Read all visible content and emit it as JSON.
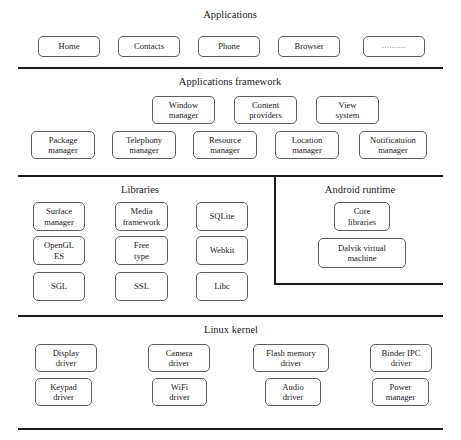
{
  "diagram": {
    "accent_color": "#1c1c1c",
    "box_border_color": "#5d5d5d"
  },
  "layers": [
    {
      "id": "applications",
      "caption": "Applications",
      "nodes": [
        {
          "label": "Home",
          "x": 38,
          "y": 36,
          "w": 62,
          "h": 21
        },
        {
          "label": "Contacts",
          "x": 118,
          "y": 36,
          "w": 62,
          "h": 21
        },
        {
          "label": "Phone",
          "x": 198,
          "y": 36,
          "w": 62,
          "h": 21
        },
        {
          "label": "Browser",
          "x": 278,
          "y": 36,
          "w": 62,
          "h": 21
        },
        {
          "label": "..........",
          "x": 363,
          "y": 36,
          "w": 62,
          "h": 21,
          "style": "dots"
        }
      ]
    },
    {
      "id": "applications-framework",
      "caption": "Applications framework",
      "nodes": [
        {
          "label": "Window\nmanager",
          "x": 152,
          "y": 96,
          "w": 63,
          "h": 28
        },
        {
          "label": "Content\nproviders",
          "x": 234,
          "y": 96,
          "w": 63,
          "h": 28
        },
        {
          "label": "View\nsystem",
          "x": 316,
          "y": 96,
          "w": 63,
          "h": 28
        },
        {
          "label": "Package\nmanager",
          "x": 31,
          "y": 131,
          "w": 64,
          "h": 28
        },
        {
          "label": "Telephony\nmanager",
          "x": 112,
          "y": 131,
          "w": 64,
          "h": 28
        },
        {
          "label": "Resource\nmanager",
          "x": 193,
          "y": 131,
          "w": 64,
          "h": 28
        },
        {
          "label": "Location\nmanager",
          "x": 275,
          "y": 131,
          "w": 64,
          "h": 28
        },
        {
          "label": "Notificatuion\nmanager",
          "x": 359,
          "y": 131,
          "w": 68,
          "h": 28
        }
      ]
    },
    {
      "id": "libraries",
      "caption": "Libraries",
      "nodes": [
        {
          "label": "Surface\nmanager",
          "x": 33,
          "y": 202,
          "w": 52,
          "h": 29
        },
        {
          "label": "Media\nframework",
          "x": 115,
          "y": 202,
          "w": 53,
          "h": 29
        },
        {
          "label": "SQLite",
          "x": 196,
          "y": 202,
          "w": 52,
          "h": 29
        },
        {
          "label": "OpenGL\nES",
          "x": 33,
          "y": 236,
          "w": 52,
          "h": 29
        },
        {
          "label": "Free\ntype",
          "x": 115,
          "y": 236,
          "w": 53,
          "h": 29
        },
        {
          "label": "Webkit",
          "x": 196,
          "y": 236,
          "w": 52,
          "h": 29
        },
        {
          "label": "SGL",
          "x": 33,
          "y": 272,
          "w": 52,
          "h": 29
        },
        {
          "label": "SSL",
          "x": 115,
          "y": 272,
          "w": 53,
          "h": 29
        },
        {
          "label": "Libc",
          "x": 196,
          "y": 272,
          "w": 52,
          "h": 29
        }
      ]
    },
    {
      "id": "android-runtime",
      "caption": "Android runtime",
      "nodes": [
        {
          "label": "Core\nlibraries",
          "x": 334,
          "y": 202,
          "w": 56,
          "h": 29
        },
        {
          "label": "Dalvik virtual\nmachine",
          "x": 318,
          "y": 238,
          "w": 88,
          "h": 30
        }
      ]
    },
    {
      "id": "linux-kernel",
      "caption": "Linux kernel",
      "nodes": [
        {
          "label": "Display\ndriver",
          "x": 35,
          "y": 344,
          "w": 62,
          "h": 28
        },
        {
          "label": "Camera\ndriver",
          "x": 148,
          "y": 344,
          "w": 62,
          "h": 28
        },
        {
          "label": "Flash memory\ndriver",
          "x": 253,
          "y": 344,
          "w": 76,
          "h": 28
        },
        {
          "label": "Binder IPC\ndriver",
          "x": 370,
          "y": 344,
          "w": 62,
          "h": 28
        },
        {
          "label": "Keypad\ndriver",
          "x": 35,
          "y": 378,
          "w": 57,
          "h": 28
        },
        {
          "label": "WiFi\ndriver",
          "x": 152,
          "y": 378,
          "w": 55,
          "h": 28
        },
        {
          "label": "Audio\ndriver",
          "x": 265,
          "y": 378,
          "w": 56,
          "h": 28
        },
        {
          "label": "Power\nmanager",
          "x": 372,
          "y": 378,
          "w": 57,
          "h": 28
        }
      ]
    }
  ],
  "captions": [
    {
      "text": "Applications",
      "x": 180,
      "y": 9,
      "w": 100
    },
    {
      "text": "Applications framework",
      "x": 165,
      "y": 76,
      "w": 130
    },
    {
      "text": "Libraries",
      "x": 105,
      "y": 184,
      "w": 70
    },
    {
      "text": "Android runtime",
      "x": 310,
      "y": 184,
      "w": 100
    },
    {
      "text": "Linux kernel",
      "x": 186,
      "y": 324,
      "w": 90
    }
  ],
  "rules": [
    {
      "name": "rule-below-applications",
      "orient": "h",
      "x": 18,
      "y": 67,
      "len": 425
    },
    {
      "name": "rule-below-framework",
      "orient": "h",
      "x": 18,
      "y": 175,
      "len": 425
    },
    {
      "name": "rule-runtime-divider",
      "orient": "v",
      "x": 274,
      "y": 176,
      "len": 109
    },
    {
      "name": "rule-below-runtime",
      "orient": "h",
      "x": 274,
      "y": 283,
      "len": 169
    },
    {
      "name": "rule-below-libraries",
      "orient": "h",
      "x": 18,
      "y": 315,
      "len": 425
    },
    {
      "name": "rule-below-kernel",
      "orient": "h",
      "x": 18,
      "y": 428,
      "len": 425
    }
  ]
}
